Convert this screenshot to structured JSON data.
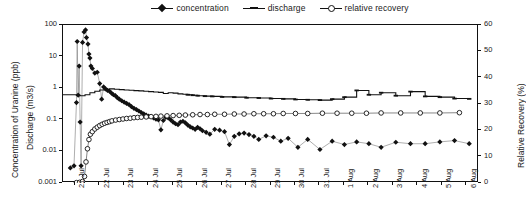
{
  "legend": {
    "items": [
      {
        "label": "concentration",
        "marker": "filled-diamond-line",
        "color": "#111111"
      },
      {
        "label": "discharge",
        "marker": "dash-line",
        "color": "#111111"
      },
      {
        "label": "relative recovery",
        "marker": "open-circle-line",
        "color": "#111111"
      }
    ]
  },
  "chart_data": {
    "type": "line",
    "title": "",
    "xlabel": "",
    "ylabel": "Concentration of Uranine (ppb)",
    "ylabel2": "Discharge (m3/s)",
    "y2label": "Relative Recovery (%)",
    "yscale": "log",
    "ylim": [
      0.001,
      100
    ],
    "yticks": [
      "100",
      "10",
      "1",
      "0.1",
      "0.01",
      "0.001"
    ],
    "y2lim": [
      0,
      60
    ],
    "y2ticks": [
      "0",
      "10",
      "20",
      "30",
      "40",
      "50",
      "60"
    ],
    "grid": false,
    "legend_position": "top-center",
    "xticklabels": [
      "21 Jul",
      "22 Jul",
      "23 Jul",
      "24 Jul",
      "25 Jul",
      "26 Jul",
      "27 Jul",
      "28 Jul",
      "29 Jul",
      "30 Jul",
      "31 Jul",
      "1 Aug",
      "2 Aug",
      "3 Aug",
      "4 Aug",
      "5 Aug",
      "6 Aug"
    ],
    "x_start_day": 21,
    "x_n_days": 17,
    "series": [
      {
        "name": "concentration",
        "axis": "left",
        "units": "ppb",
        "marker": "filled-diamond",
        "points": [
          [
            21.3,
            0.003
          ],
          [
            21.45,
            0.0035
          ],
          [
            21.55,
            0.35
          ],
          [
            21.58,
            30.0
          ],
          [
            21.62,
            0.6
          ],
          [
            21.66,
            5.0
          ],
          [
            21.7,
            0.085
          ],
          [
            21.74,
            0.0035
          ],
          [
            21.8,
            28.0
          ],
          [
            21.86,
            60.0
          ],
          [
            21.92,
            70.0
          ],
          [
            21.96,
            40.0
          ],
          [
            22.02,
            25.0
          ],
          [
            22.06,
            12.0
          ],
          [
            22.1,
            9.0
          ],
          [
            22.14,
            5.0
          ],
          [
            22.2,
            4.2
          ],
          [
            22.3,
            3.0
          ],
          [
            22.4,
            3.2
          ],
          [
            22.5,
            1.4
          ],
          [
            22.58,
            0.45
          ],
          [
            22.66,
            1.1
          ],
          [
            22.74,
            0.95
          ],
          [
            22.82,
            0.85
          ],
          [
            22.9,
            0.8
          ],
          [
            22.98,
            0.7
          ],
          [
            23.06,
            0.62
          ],
          [
            23.14,
            0.58
          ],
          [
            23.22,
            0.5
          ],
          [
            23.3,
            0.45
          ],
          [
            23.4,
            0.4
          ],
          [
            23.5,
            0.36
          ],
          [
            23.6,
            0.33
          ],
          [
            23.7,
            0.3
          ],
          [
            23.8,
            0.26
          ],
          [
            23.9,
            0.23
          ],
          [
            24.0,
            0.21
          ],
          [
            24.1,
            0.19
          ],
          [
            24.2,
            0.17
          ],
          [
            24.3,
            0.155
          ],
          [
            24.4,
            0.14
          ],
          [
            24.5,
            0.13
          ],
          [
            24.6,
            0.125
          ],
          [
            24.7,
            0.115
          ],
          [
            24.8,
            0.105
          ],
          [
            24.9,
            0.1
          ],
          [
            25.0,
            0.048
          ],
          [
            25.1,
            0.095
          ],
          [
            25.2,
            0.12
          ],
          [
            25.3,
            0.115
          ],
          [
            25.4,
            0.1
          ],
          [
            25.5,
            0.085
          ],
          [
            25.6,
            0.075
          ],
          [
            25.7,
            0.07
          ],
          [
            25.8,
            0.085
          ],
          [
            25.9,
            0.09
          ],
          [
            26.0,
            0.08
          ],
          [
            26.1,
            0.068
          ],
          [
            26.2,
            0.06
          ],
          [
            26.3,
            0.055
          ],
          [
            26.4,
            0.05
          ],
          [
            26.5,
            0.058
          ],
          [
            26.6,
            0.052
          ],
          [
            26.7,
            0.045
          ],
          [
            26.85,
            0.04
          ],
          [
            27.0,
            0.035
          ],
          [
            27.2,
            0.05
          ],
          [
            27.4,
            0.047
          ],
          [
            27.6,
            0.042
          ],
          [
            27.8,
            0.0165
          ],
          [
            28.0,
            0.03
          ],
          [
            28.2,
            0.036
          ],
          [
            28.4,
            0.038
          ],
          [
            28.6,
            0.034
          ],
          [
            28.8,
            0.03
          ],
          [
            29.0,
            0.024
          ],
          [
            29.3,
            0.031
          ],
          [
            29.6,
            0.028
          ],
          [
            29.9,
            0.021
          ],
          [
            30.2,
            0.026
          ],
          [
            30.6,
            0.0135
          ],
          [
            31.0,
            0.024
          ],
          [
            31.5,
            0.0115
          ],
          [
            32.0,
            0.021
          ],
          [
            32.5,
            0.0165
          ],
          [
            33.0,
            0.02
          ],
          [
            33.5,
            0.0175
          ],
          [
            34.0,
            0.0135
          ],
          [
            34.6,
            0.0195
          ],
          [
            35.2,
            0.0175
          ],
          [
            35.8,
            0.0175
          ],
          [
            36.4,
            0.02
          ],
          [
            37.0,
            0.022
          ],
          [
            37.6,
            0.0175
          ]
        ]
      },
      {
        "name": "discharge",
        "axis": "left",
        "units": "m3/s",
        "marker": "dash",
        "points": [
          [
            21.0,
            0.62
          ],
          [
            21.3,
            0.62
          ],
          [
            21.55,
            0.6
          ],
          [
            21.7,
            0.58
          ],
          [
            21.9,
            0.62
          ],
          [
            22.1,
            0.72
          ],
          [
            22.3,
            0.8
          ],
          [
            22.5,
            0.88
          ],
          [
            22.7,
            0.92
          ],
          [
            22.9,
            0.95
          ],
          [
            23.1,
            0.93
          ],
          [
            23.3,
            0.9
          ],
          [
            23.5,
            0.88
          ],
          [
            23.7,
            0.86
          ],
          [
            23.9,
            0.84
          ],
          [
            24.1,
            0.82
          ],
          [
            24.3,
            0.8
          ],
          [
            24.5,
            0.78
          ],
          [
            24.7,
            0.76
          ],
          [
            24.9,
            0.74
          ],
          [
            25.1,
            0.68
          ],
          [
            25.3,
            0.72
          ],
          [
            25.5,
            0.7
          ],
          [
            25.7,
            0.66
          ],
          [
            25.9,
            0.64
          ],
          [
            26.1,
            0.62
          ],
          [
            26.3,
            0.6
          ],
          [
            26.5,
            0.58
          ],
          [
            26.8,
            0.56
          ],
          [
            27.1,
            0.55
          ],
          [
            27.5,
            0.53
          ],
          [
            28.0,
            0.52
          ],
          [
            28.5,
            0.5
          ],
          [
            29.0,
            0.49
          ],
          [
            29.5,
            0.47
          ],
          [
            30.0,
            0.46
          ],
          [
            30.5,
            0.44
          ],
          [
            31.0,
            0.43
          ],
          [
            31.5,
            0.42
          ],
          [
            32.0,
            0.45
          ],
          [
            32.5,
            0.52
          ],
          [
            33.0,
            0.85
          ],
          [
            33.5,
            0.62
          ],
          [
            34.0,
            0.72
          ],
          [
            34.6,
            0.58
          ],
          [
            35.2,
            0.78
          ],
          [
            35.8,
            0.55
          ],
          [
            36.4,
            0.52
          ],
          [
            37.0,
            0.47
          ],
          [
            37.6,
            0.46
          ]
        ]
      },
      {
        "name": "relative recovery",
        "axis": "right",
        "units": "%",
        "marker": "open-circle",
        "points": [
          [
            21.55,
            0.15
          ],
          [
            21.68,
            0.25
          ],
          [
            21.8,
            0.6
          ],
          [
            21.88,
            2.5
          ],
          [
            21.94,
            8.0
          ],
          [
            22.0,
            13.0
          ],
          [
            22.06,
            16.5
          ],
          [
            22.12,
            18.5
          ],
          [
            22.2,
            19.5
          ],
          [
            22.3,
            20.5
          ],
          [
            22.4,
            21.2
          ],
          [
            22.5,
            21.8
          ],
          [
            22.6,
            22.3
          ],
          [
            22.7,
            22.7
          ],
          [
            22.8,
            23.0
          ],
          [
            22.9,
            23.3
          ],
          [
            23.0,
            23.6
          ],
          [
            23.15,
            23.9
          ],
          [
            23.3,
            24.1
          ],
          [
            23.45,
            24.3
          ],
          [
            23.6,
            24.5
          ],
          [
            23.75,
            24.6
          ],
          [
            23.9,
            24.8
          ],
          [
            24.05,
            24.9
          ],
          [
            24.2,
            25.0
          ],
          [
            24.4,
            25.1
          ],
          [
            24.6,
            25.2
          ],
          [
            24.8,
            25.3
          ],
          [
            25.0,
            25.4
          ],
          [
            25.25,
            25.5
          ],
          [
            25.5,
            25.6
          ],
          [
            25.75,
            25.7
          ],
          [
            26.0,
            25.8
          ],
          [
            26.3,
            25.9
          ],
          [
            26.6,
            26.0
          ],
          [
            26.9,
            26.0
          ],
          [
            27.2,
            26.1
          ],
          [
            27.6,
            26.1
          ],
          [
            28.0,
            26.2
          ],
          [
            28.4,
            26.2
          ],
          [
            28.8,
            26.3
          ],
          [
            29.2,
            26.3
          ],
          [
            29.6,
            26.3
          ],
          [
            30.0,
            26.4
          ],
          [
            30.5,
            26.4
          ],
          [
            31.0,
            26.4
          ],
          [
            31.6,
            26.5
          ],
          [
            32.2,
            26.5
          ],
          [
            32.8,
            26.5
          ],
          [
            33.4,
            26.5
          ],
          [
            34.0,
            26.6
          ],
          [
            34.8,
            26.6
          ],
          [
            35.6,
            26.6
          ],
          [
            36.4,
            26.6
          ],
          [
            37.2,
            26.7
          ]
        ]
      }
    ]
  }
}
